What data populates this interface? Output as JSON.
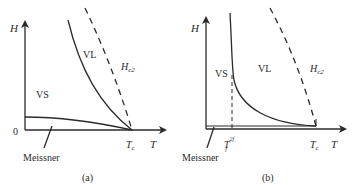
{
  "panels": [
    {
      "id": "a",
      "caption": "(a)",
      "y_axis_label": "H",
      "x_axis_label": "T",
      "origin_label": "0",
      "tc_label": "T",
      "tc_sub": "c",
      "regions": {
        "vs": "VS",
        "vl": "VL"
      },
      "hc2_label": "H",
      "hc2_sub": "c2",
      "meissner_label": "Meissner"
    },
    {
      "id": "b",
      "caption": "(b)",
      "y_axis_label": "H",
      "x_axis_label": "T",
      "tc_label": "T",
      "tc_sub": "c",
      "tf_label": "T",
      "tf_sub": "f",
      "tf_sup": "2f",
      "regions": {
        "vs": "VS",
        "vl": "VL"
      },
      "hc2_label": "H",
      "hc2_sub": "c2",
      "meissner_label": "Meissner"
    }
  ],
  "colors": {
    "ink": "#2a2a2a"
  }
}
